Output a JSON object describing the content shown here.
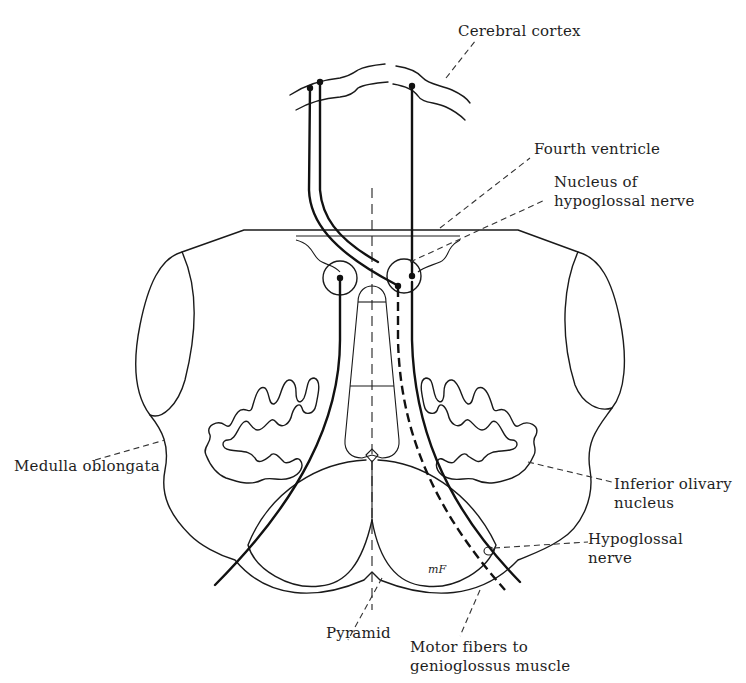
{
  "figure": {
    "signature": "mF",
    "colors": {
      "ink": "#1a1a1a",
      "background": "#ffffff"
    }
  },
  "labels": {
    "cerebral_cortex": "Cerebral cortex",
    "fourth_ventricle": "Fourth ventricle",
    "nucleus_line1": "Nucleus of",
    "nucleus_line2": "hypoglossal nerve",
    "medulla_oblongata": "Medulla oblongata",
    "inferior_olivary_line1": "Inferior olivary",
    "inferior_olivary_line2": "nucleus",
    "hypoglossal_line1": "Hypoglossal",
    "hypoglossal_line2": "nerve",
    "pyramid": "Pyramid",
    "motor_line1": "Motor fibers to",
    "motor_line2": "genioglossus muscle"
  }
}
